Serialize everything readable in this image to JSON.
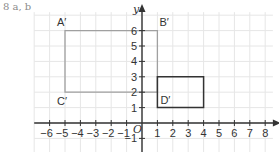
{
  "question_label": "8  a, b",
  "axes": {
    "x_label": "x",
    "y_label": "y",
    "origin_label": "O",
    "x_ticks": [
      -6,
      -5,
      -4,
      -3,
      -2,
      -1,
      1,
      2,
      3,
      4,
      5,
      6,
      7,
      8
    ],
    "y_ticks": [
      -1,
      1,
      2,
      3,
      4,
      5,
      6
    ],
    "x_range": [
      -7,
      8.5
    ],
    "y_range": [
      -1.9,
      7.2
    ]
  },
  "shapes": {
    "image_rectangle": {
      "name": "A'B'D'C'",
      "color": "#999999",
      "vertices": {
        "A'": [
          -5,
          6
        ],
        "B'": [
          1,
          6
        ],
        "D'": [
          1,
          2
        ],
        "C'": [
          -5,
          2
        ]
      }
    },
    "object_rectangle": {
      "color": "#333333",
      "vertices": [
        [
          1,
          3
        ],
        [
          4,
          3
        ],
        [
          4,
          1
        ],
        [
          1,
          1
        ]
      ]
    }
  },
  "point_labels": {
    "a": "A′",
    "b": "B′",
    "c": "C′",
    "d": "D′"
  },
  "colors": {
    "grid": "#e6e6e6",
    "axis": "#333333",
    "image_rect": "#a0a0a0",
    "object_rect": "#333333"
  }
}
